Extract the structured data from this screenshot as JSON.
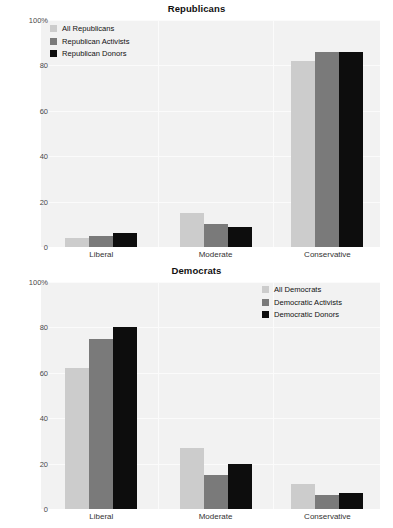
{
  "chart_data": [
    {
      "type": "bar",
      "title": "Republicans",
      "xlabel": "",
      "ylabel": "",
      "ylim": [
        0,
        100
      ],
      "grid": true,
      "legend_position": "top-left",
      "categories": [
        "Liberal",
        "Moderate",
        "Conservative"
      ],
      "ytick_labels": [
        "0",
        "20",
        "40",
        "60",
        "80",
        "100%"
      ],
      "ytick_values": [
        0,
        20,
        40,
        60,
        80,
        100
      ],
      "series": [
        {
          "name": "All Republicans",
          "color": "#cccccc",
          "values": [
            4,
            15,
            82
          ]
        },
        {
          "name": "Republican Activists",
          "color": "#7a7a7a",
          "values": [
            5,
            10,
            86
          ]
        },
        {
          "name": "Republican Donors",
          "color": "#0d0d0d",
          "values": [
            6,
            9,
            86
          ]
        }
      ]
    },
    {
      "type": "bar",
      "title": "Democrats",
      "xlabel": "",
      "ylabel": "",
      "ylim": [
        0,
        100
      ],
      "grid": true,
      "legend_position": "top-right",
      "categories": [
        "Liberal",
        "Moderate",
        "Conservative"
      ],
      "ytick_labels": [
        "0",
        "20",
        "40",
        "60",
        "80",
        "100%"
      ],
      "ytick_values": [
        0,
        20,
        40,
        60,
        80,
        100
      ],
      "series": [
        {
          "name": "All Democrats",
          "color": "#cccccc",
          "values": [
            62,
            27,
            11
          ]
        },
        {
          "name": "Democratic Activists",
          "color": "#7a7a7a",
          "values": [
            75,
            15,
            6
          ]
        },
        {
          "name": "Democratic Donors",
          "color": "#0d0d0d",
          "values": [
            80,
            20,
            7
          ]
        }
      ]
    }
  ],
  "figures": {
    "republicans": {
      "title": "Republicans",
      "ytick_labels": [
        "100%",
        "80",
        "60",
        "40",
        "20",
        "0"
      ],
      "categories": [
        "Liberal",
        "Moderate",
        "Conservative"
      ],
      "legend": [
        {
          "label": "All Republicans",
          "color": "#cccccc"
        },
        {
          "label": "Republican Activists",
          "color": "#7a7a7a"
        },
        {
          "label": "Republican Donors",
          "color": "#0d0d0d"
        }
      ]
    },
    "democrats": {
      "title": "Democrats",
      "ytick_labels": [
        "100%",
        "80",
        "60",
        "40",
        "20",
        "0"
      ],
      "categories": [
        "Liberal",
        "Moderate",
        "Conservative"
      ],
      "legend": [
        {
          "label": "All Democrats",
          "color": "#cccccc"
        },
        {
          "label": "Democratic Activists",
          "color": "#7a7a7a"
        },
        {
          "label": "Democratic Donors",
          "color": "#0d0d0d"
        }
      ]
    }
  },
  "colors": {
    "plot_background": "#f2f2f2",
    "gridline": "#fbfbfb",
    "page_background": "#ffffff",
    "text": "#111111"
  }
}
